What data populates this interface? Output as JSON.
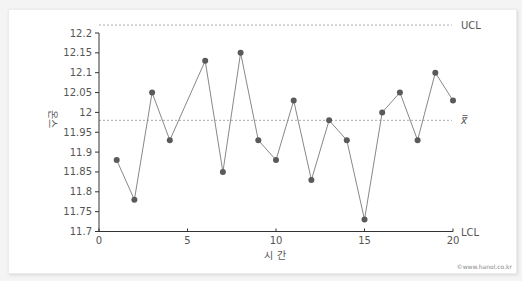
{
  "chart_data": {
    "type": "line",
    "title": "",
    "xlabel": "시 간",
    "ylabel": "온스",
    "xlim": [
      0,
      20
    ],
    "ylim": [
      11.7,
      12.2
    ],
    "x_ticks": [
      0,
      5,
      10,
      15,
      20
    ],
    "y_ticks": [
      11.7,
      11.75,
      11.8,
      11.85,
      11.9,
      11.95,
      12,
      12.05,
      12.1,
      12.15,
      12.2
    ],
    "y_tick_labels": [
      "11.7",
      "11.75",
      "11.8",
      "11.85",
      "11.9",
      "11.95",
      "12",
      "12.05",
      "12.1",
      "12.15",
      "12.2"
    ],
    "grid": false,
    "series": [
      {
        "name": "sample mean",
        "x": [
          1,
          2,
          3,
          4,
          6,
          7,
          8,
          9,
          10,
          11,
          12,
          13,
          14,
          15,
          16,
          17,
          18,
          19,
          20
        ],
        "values": [
          11.88,
          11.78,
          12.05,
          11.93,
          12.13,
          11.85,
          12.15,
          11.93,
          11.88,
          12.03,
          11.83,
          11.98,
          11.93,
          11.73,
          12.0,
          12.05,
          11.93,
          12.1,
          12.03
        ]
      }
    ],
    "reference_lines": [
      {
        "label": "UCL",
        "value": 12.22
      },
      {
        "label": "x̿",
        "value": 11.98
      },
      {
        "label": "LCL",
        "value": 11.7
      }
    ]
  },
  "credit": "©www.hanol.co.kr",
  "colors": {
    "line": "#888888",
    "marker": "#5a5a5a",
    "axis": "#333333",
    "ref": "#aaaaaa"
  }
}
